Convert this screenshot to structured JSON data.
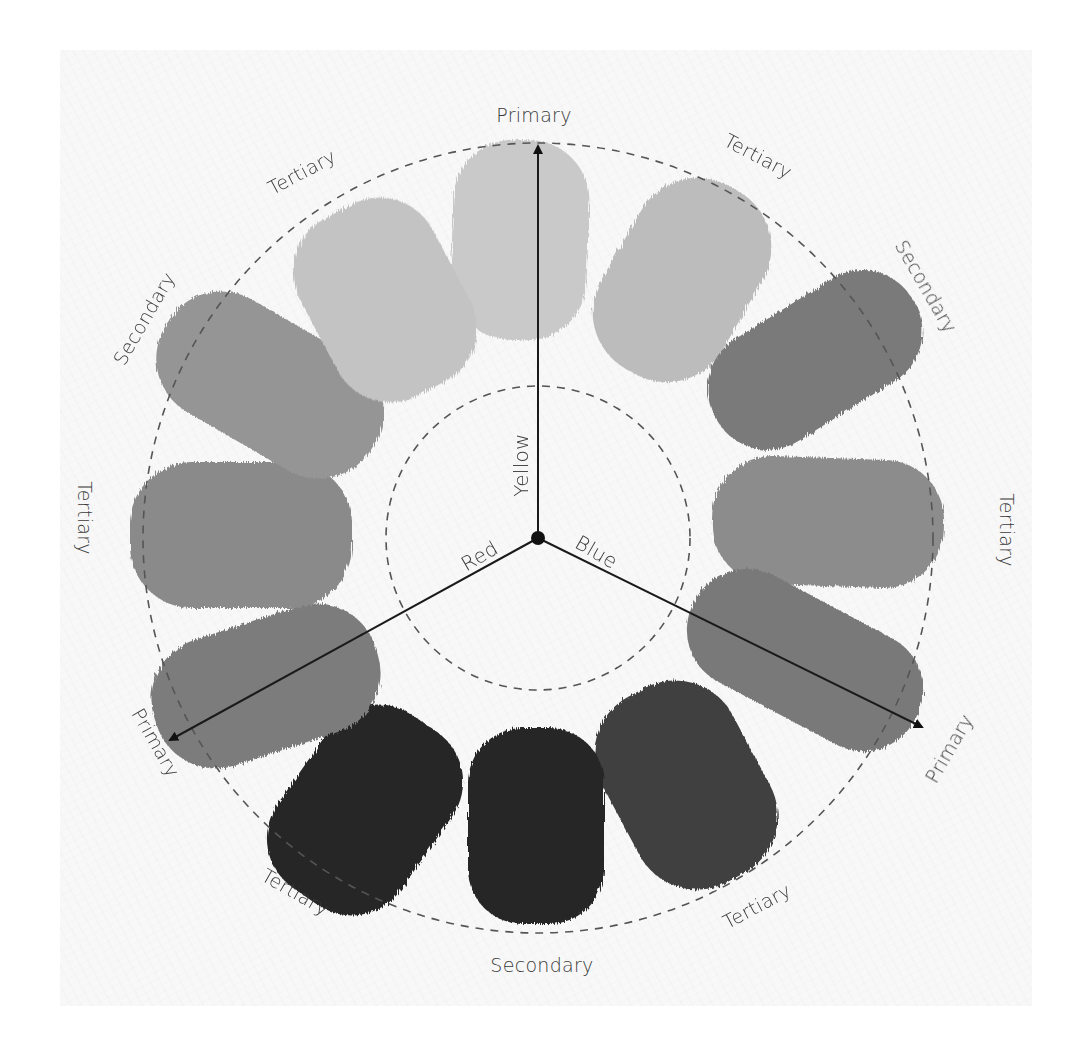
{
  "diagram": {
    "type": "color-wheel",
    "center": {
      "dot_color": "#111111"
    },
    "axes": [
      {
        "name": "yellow",
        "label": "Yellow",
        "end_label": "Primary",
        "direction": "up"
      },
      {
        "name": "red",
        "label": "Red",
        "end_label": "Primary",
        "direction": "lower-left"
      },
      {
        "name": "blue",
        "label": "Blue",
        "end_label": "Primary",
        "direction": "lower-right"
      }
    ],
    "ring_labels": {
      "top": "Primary",
      "top_right": "Tertiary",
      "right_upper": "Secondary",
      "right": "Tertiary",
      "bottom_right_primary": "Primary",
      "bottom_right": "Tertiary",
      "bottom": "Secondary",
      "bottom_left": "Tertiary",
      "left_lower_primary": "Primary",
      "left": "Tertiary",
      "left_upper": "Secondary",
      "top_left": "Tertiary"
    },
    "swatches": [
      {
        "position": "top",
        "category": "Primary",
        "shade": "#c9c9c9"
      },
      {
        "position": "top-right",
        "category": "Tertiary",
        "shade": "#bcbcbc"
      },
      {
        "position": "upper-right",
        "category": "Secondary",
        "shade": "#7a7a7a"
      },
      {
        "position": "right",
        "category": "Tertiary",
        "shade": "#8c8c8c"
      },
      {
        "position": "lower-right",
        "category": "Primary",
        "shade": "#797979"
      },
      {
        "position": "bottom-right",
        "category": "Tertiary",
        "shade": "#3f3f3f"
      },
      {
        "position": "bottom",
        "category": "Secondary",
        "shade": "#272727"
      },
      {
        "position": "bottom-left",
        "category": "Tertiary",
        "shade": "#262626"
      },
      {
        "position": "lower-left",
        "category": "Primary",
        "shade": "#7c7c7c"
      },
      {
        "position": "left",
        "category": "Tertiary",
        "shade": "#8a8a8a"
      },
      {
        "position": "upper-left",
        "category": "Secondary",
        "shade": "#959595"
      },
      {
        "position": "top-left",
        "category": "Tertiary",
        "shade": "#c3c3c3"
      }
    ],
    "colors": {
      "background": "#f8f8f8",
      "line": "#1a1a1a",
      "dashed_circle": "#555555",
      "text": "#3a3a3a"
    }
  }
}
